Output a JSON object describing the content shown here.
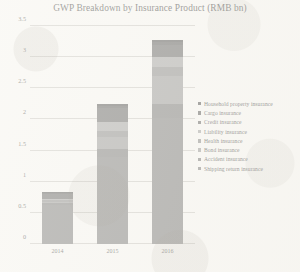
{
  "chart_data": {
    "type": "bar",
    "subtype": "stacked-bar",
    "title": "GWP Breakdown by Insurance Product (RMB bn)",
    "xlabel": "",
    "ylabel": "",
    "categories": [
      "2014",
      "2015",
      "2016"
    ],
    "ylim": [
      0,
      3.5
    ],
    "yticks": [
      0,
      0.5,
      1,
      1.5,
      2,
      2.5,
      3,
      3.5
    ],
    "ytick_labels": [
      "0",
      "0.5",
      "1",
      "1.5",
      "2",
      "2.5",
      "3",
      "3.5"
    ],
    "grid": true,
    "grid_axis": "y",
    "legend_position": "right",
    "series": [
      {
        "name": "Shipping return insurance",
        "color": "#6f6f6f",
        "values": [
          0.62,
          1.4,
          2.03
        ]
      },
      {
        "name": "Accident insurance",
        "color": "#6a6a6a",
        "values": [
          0.04,
          0.12,
          0.22
        ]
      },
      {
        "name": "Bond insurance",
        "color": "#8e8e8e",
        "values": [
          0.02,
          0.2,
          0.45
        ]
      },
      {
        "name": "Health insurance",
        "color": "#7d7d7d",
        "values": [
          0.02,
          0.1,
          0.14
        ]
      },
      {
        "name": "Liability insurance",
        "color": "#9a9a9a",
        "values": [
          0.02,
          0.14,
          0.16
        ]
      },
      {
        "name": "Credit insurance",
        "color": "#555555",
        "values": [
          0.08,
          0.22,
          0.2
        ]
      },
      {
        "name": "Cargo insurance",
        "color": "#4a4a4a",
        "values": [
          0.02,
          0.04,
          0.05
        ]
      },
      {
        "name": "Household property insurance",
        "color": "#3f3f3f",
        "values": [
          0.01,
          0.03,
          0.03
        ]
      }
    ],
    "totals": [
      0.83,
      2.25,
      3.28
    ],
    "annotations": []
  },
  "legend": {
    "items": [
      {
        "label": "Household property insurance",
        "color": "#3f3f3f"
      },
      {
        "label": "Cargo insurance",
        "color": "#4a4a4a"
      },
      {
        "label": "Credit insurance",
        "color": "#555555"
      },
      {
        "label": "Liability insurance",
        "color": "#9a9a9a"
      },
      {
        "label": "Health insurance",
        "color": "#7d7d7d"
      },
      {
        "label": "Bond insurance",
        "color": "#8e8e8e"
      },
      {
        "label": "Accident insurance",
        "color": "#6a6a6a"
      },
      {
        "label": "Shipping return insurance",
        "color": "#6f6f6f"
      }
    ]
  },
  "colors": {
    "background": "#fbfaf7",
    "gridline": "#c9c7c2",
    "text": "#2b2b2b"
  }
}
